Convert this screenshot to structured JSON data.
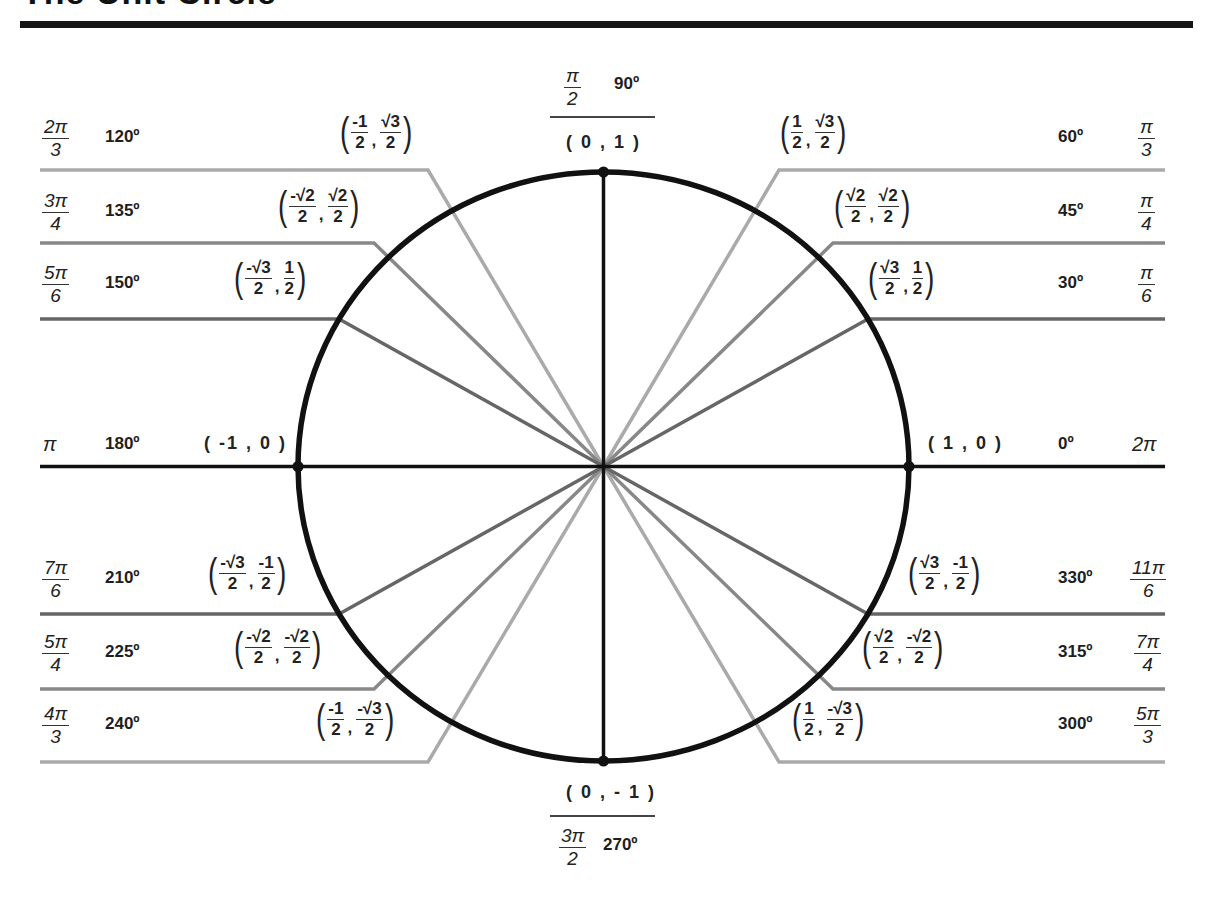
{
  "title": "The Unit Circle",
  "colors": {
    "circle": "#111111",
    "axis": "#111111",
    "light_line": "#aaaaaa",
    "medium_line": "#888888",
    "dark_line": "#666666"
  },
  "geometry": {
    "cx": 603.5,
    "cy": 466.5,
    "rx": 305.5,
    "ry": 294.5
  },
  "angles": [
    {
      "id": "a0",
      "radians": "2π",
      "rad_num": "2π",
      "rad_den": "",
      "degrees": "0º",
      "coord": "( 1 , 0 )"
    },
    {
      "id": "a30",
      "radians": "π/6",
      "rad_num": "π",
      "rad_den": "6",
      "degrees": "30º",
      "x_num": "√3",
      "x_den": "2",
      "y_num": "1",
      "y_den": "2"
    },
    {
      "id": "a45",
      "radians": "π/4",
      "rad_num": "π",
      "rad_den": "4",
      "degrees": "45º",
      "x_num": "√2",
      "x_den": "2",
      "y_num": "√2",
      "y_den": "2"
    },
    {
      "id": "a60",
      "radians": "π/3",
      "rad_num": "π",
      "rad_den": "3",
      "degrees": "60º",
      "x_num": "1",
      "x_den": "2",
      "y_num": "√3",
      "y_den": "2"
    },
    {
      "id": "a90",
      "radians": "π/2",
      "rad_num": "π",
      "rad_den": "2",
      "degrees": "90º",
      "coord": "( 0 , 1 )"
    },
    {
      "id": "a120",
      "radians": "2π/3",
      "rad_num": "2π",
      "rad_den": "3",
      "degrees": "120º",
      "x_num": "-1",
      "x_den": "2",
      "y_num": "√3",
      "y_den": "2"
    },
    {
      "id": "a135",
      "radians": "3π/4",
      "rad_num": "3π",
      "rad_den": "4",
      "degrees": "135º",
      "x_num": "-√2",
      "x_den": "2",
      "y_num": "√2",
      "y_den": "2"
    },
    {
      "id": "a150",
      "radians": "5π/6",
      "rad_num": "5π",
      "rad_den": "6",
      "degrees": "150º",
      "x_num": "-√3",
      "x_den": "2",
      "y_num": "1",
      "y_den": "2"
    },
    {
      "id": "a180",
      "radians": "π",
      "rad_num": "π",
      "rad_den": "",
      "degrees": "180º",
      "coord": "( -1 , 0 )"
    },
    {
      "id": "a210",
      "radians": "7π/6",
      "rad_num": "7π",
      "rad_den": "6",
      "degrees": "210º",
      "x_num": "-√3",
      "x_den": "2",
      "y_num": "-1",
      "y_den": "2"
    },
    {
      "id": "a225",
      "radians": "5π/4",
      "rad_num": "5π",
      "rad_den": "4",
      "degrees": "225º",
      "x_num": "-√2",
      "x_den": "2",
      "y_num": "-√2",
      "y_den": "2"
    },
    {
      "id": "a240",
      "radians": "4π/3",
      "rad_num": "4π",
      "rad_den": "3",
      "degrees": "240º",
      "x_num": "-1",
      "x_den": "2",
      "y_num": "-√3",
      "y_den": "2"
    },
    {
      "id": "a270",
      "radians": "3π/2",
      "rad_num": "3π",
      "rad_den": "2",
      "degrees": "270º",
      "coord": "( 0 , - 1 )"
    },
    {
      "id": "a300",
      "radians": "5π/3",
      "rad_num": "5π",
      "rad_den": "3",
      "degrees": "300º",
      "x_num": "1",
      "x_den": "2",
      "y_num": "-√3",
      "y_den": "2"
    },
    {
      "id": "a315",
      "radians": "7π/4",
      "rad_num": "7π",
      "rad_den": "4",
      "degrees": "315º",
      "x_num": "√2",
      "x_den": "2",
      "y_num": "-√2",
      "y_den": "2"
    },
    {
      "id": "a330",
      "radians": "11π/6",
      "rad_num": "11π",
      "rad_den": "6",
      "degrees": "330º",
      "x_num": "√3",
      "x_den": "2",
      "y_num": "-1",
      "y_den": "2"
    }
  ]
}
